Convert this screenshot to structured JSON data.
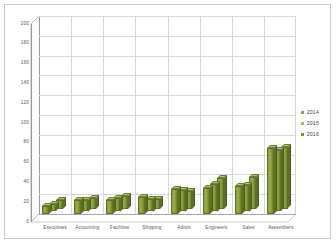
{
  "chart_data": {
    "type": "bar",
    "title": "",
    "subtitle": "",
    "xlabel": "",
    "ylabel": "",
    "ylim": [
      0,
      200
    ],
    "ytick_step": 20,
    "yticks": [
      0,
      20,
      40,
      60,
      80,
      100,
      120,
      140,
      160,
      180,
      200
    ],
    "grid": true,
    "legend_position": "right",
    "style": "3d-clustered-column",
    "categories": [
      "Executives",
      "Accounting",
      "Facilities",
      "Shipping",
      "Admin",
      "Engineers",
      "Sales",
      "Assemblers"
    ],
    "series": [
      {
        "name": "2014",
        "color": "#8ea53e",
        "values": [
          8,
          14,
          14,
          17,
          25,
          26,
          28,
          67
        ]
      },
      {
        "name": "2015",
        "color": "#a8bd52",
        "values": [
          7,
          12,
          14,
          13,
          22,
          28,
          27,
          62
        ]
      },
      {
        "name": "2016",
        "color": "#7d9134",
        "values": [
          9,
          11,
          13,
          10,
          18,
          31,
          32,
          62
        ]
      }
    ]
  },
  "legend": {
    "items": [
      {
        "label": "2014",
        "color": "#8ea53e"
      },
      {
        "label": "2015",
        "color": "#a8bd52"
      },
      {
        "label": "2016",
        "color": "#7d9134"
      }
    ]
  },
  "colors": {
    "bar_front": "#8ea53e",
    "bar_top": "#b4c768",
    "bar_side": "#5c6f27",
    "gridline": "#d8d8d8",
    "axis": "#9a9a9a",
    "tick_text": "#555555",
    "frame_border": "#c9c9c9",
    "background": "#ffffff"
  }
}
